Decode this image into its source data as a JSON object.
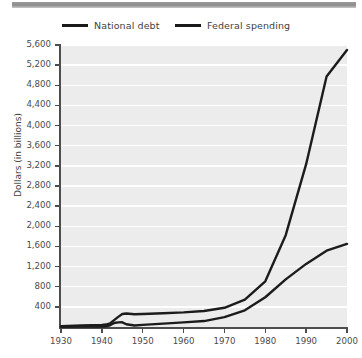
{
  "legend": {
    "items": [
      {
        "label": "National debt",
        "color": "#1c1c1c"
      },
      {
        "label": "Federal spending",
        "color": "#1c1c1c"
      }
    ]
  },
  "axes": {
    "y_title": "Dollars (in billions)",
    "y_ticks": [
      "5,600",
      "5,200",
      "4,800",
      "4,400",
      "4,000",
      "3,600",
      "3,200",
      "2,800",
      "2,400",
      "2,000",
      "1,600",
      "1,200",
      "800",
      "400"
    ],
    "x_ticks": [
      "1930",
      "1940",
      "1950",
      "1960",
      "1970",
      "1980",
      "1990",
      "2000"
    ]
  },
  "chart_data": {
    "type": "line",
    "title": "",
    "xlabel": "",
    "ylabel": "Dollars (in billions)",
    "xlim": [
      1930,
      2000
    ],
    "ylim": [
      0,
      5600
    ],
    "ytick_step": 400,
    "grid": true,
    "legend_position": "top",
    "x": [
      1930,
      1935,
      1940,
      1941,
      1942,
      1943,
      1944,
      1945,
      1946,
      1948,
      1950,
      1955,
      1960,
      1965,
      1970,
      1975,
      1980,
      1985,
      1990,
      1995,
      2000
    ],
    "series": [
      {
        "name": "National debt",
        "color": "#1c1c1c",
        "values": [
          16,
          29,
          43,
          49,
          72,
          137,
          201,
          259,
          269,
          252,
          257,
          274,
          291,
          317,
          381,
          542,
          908,
          1823,
          3233,
          4974,
          5500
        ]
      },
      {
        "name": "Federal spending",
        "color": "#1c1c1c",
        "values": [
          3,
          7,
          9,
          14,
          35,
          79,
          91,
          93,
          55,
          30,
          43,
          68,
          92,
          118,
          196,
          332,
          591,
          946,
          1253,
          1516,
          1650
        ]
      }
    ]
  }
}
